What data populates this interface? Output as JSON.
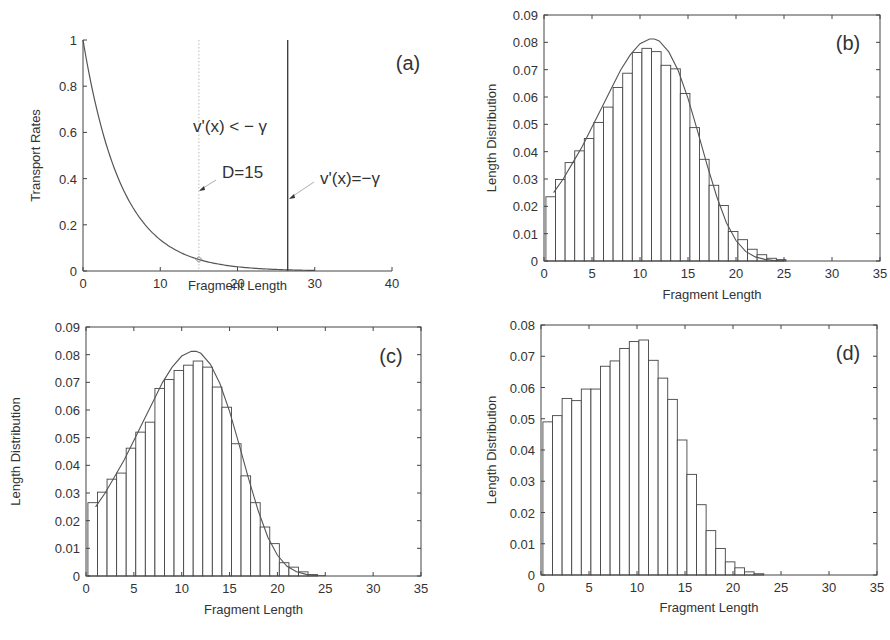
{
  "figure": {
    "panels": [
      {
        "id": "a",
        "label": "(a)"
      },
      {
        "id": "b",
        "label": "(b)"
      },
      {
        "id": "c",
        "label": "(c)"
      },
      {
        "id": "d",
        "label": "(d)"
      }
    ]
  },
  "chart_data": [
    {
      "panel": "(a)",
      "type": "line",
      "title": "",
      "xlabel": "Fragment Length",
      "ylabel": "Transport Rates",
      "xlim": [
        0,
        40
      ],
      "ylim": [
        0,
        1
      ],
      "xticks": [
        0,
        10,
        20,
        30,
        40
      ],
      "yticks": [
        0,
        0.2,
        0.4,
        0.6,
        0.8,
        1
      ],
      "ytick_labels": [
        "0",
        "0.2",
        "0.4",
        "0.6",
        "0.8",
        "1"
      ],
      "grid": false,
      "series": [
        {
          "name": "transport rate v(x)",
          "form": "exp(-x/5)",
          "x": [
            0,
            2,
            4,
            6,
            8,
            10,
            12,
            14,
            15,
            16,
            18,
            20,
            22,
            24,
            26,
            28,
            30
          ],
          "values": [
            1.0,
            0.67,
            0.449,
            0.301,
            0.202,
            0.135,
            0.091,
            0.061,
            0.05,
            0.041,
            0.027,
            0.018,
            0.012,
            0.008,
            0.0055,
            0.0037,
            0.0025
          ]
        }
      ],
      "vlines": [
        {
          "x": 15,
          "style": "dotted",
          "annotation": "D=15"
        },
        {
          "x": 26.5,
          "style": "solid",
          "annotation": "v'(x)=-γ"
        }
      ],
      "marker": {
        "x": 15,
        "y": 0.05,
        "shape": "diamond"
      },
      "annotations": [
        "v'(x) < − γ",
        "D=15",
        "v'(x)=−γ"
      ]
    },
    {
      "panel": "(b)",
      "type": "bar",
      "title": "",
      "xlabel": "Fragment Length",
      "ylabel": "Length Distribution",
      "xlim": [
        0,
        35
      ],
      "ylim": [
        0,
        0.09
      ],
      "xticks": [
        0,
        5,
        10,
        15,
        20,
        25,
        30,
        35
      ],
      "yticks": [
        0,
        0.01,
        0.02,
        0.03,
        0.04,
        0.05,
        0.06,
        0.07,
        0.08,
        0.09
      ],
      "ytick_labels": [
        "0",
        "0.01",
        "0.02",
        "0.03",
        "0.04",
        "0.05",
        "0.06",
        "0.07",
        "0.08",
        "0.09"
      ],
      "bin_start": 0.2,
      "bin_width": 1,
      "values": [
        0.0235,
        0.0298,
        0.036,
        0.0403,
        0.0448,
        0.0507,
        0.0563,
        0.0635,
        0.0687,
        0.0763,
        0.0778,
        0.0766,
        0.0716,
        0.0703,
        0.0613,
        0.0488,
        0.0372,
        0.0277,
        0.0203,
        0.0108,
        0.0078,
        0.0043,
        0.0023,
        0.001,
        0.0005
      ],
      "fit_curve": {
        "x": [
          1,
          2,
          3,
          4,
          5,
          6,
          7,
          8,
          9,
          10,
          11,
          11.5,
          12,
          13,
          14,
          15,
          16,
          17,
          18,
          19,
          20,
          21,
          22,
          23,
          24,
          25
        ],
        "values": [
          0.025,
          0.03,
          0.036,
          0.042,
          0.049,
          0.056,
          0.063,
          0.07,
          0.0755,
          0.0795,
          0.0812,
          0.0812,
          0.0805,
          0.0765,
          0.0695,
          0.0595,
          0.0475,
          0.035,
          0.0235,
          0.014,
          0.0075,
          0.0035,
          0.0015,
          0.0006,
          0.0002,
          0.0001
        ]
      },
      "grid": false
    },
    {
      "panel": "(c)",
      "type": "bar",
      "title": "",
      "xlabel": "Fragment Length",
      "ylabel": "Length Distribution",
      "xlim": [
        0,
        35
      ],
      "ylim": [
        0,
        0.09
      ],
      "xticks": [
        0,
        5,
        10,
        15,
        20,
        25,
        30,
        35
      ],
      "yticks": [
        0,
        0.01,
        0.02,
        0.03,
        0.04,
        0.05,
        0.06,
        0.07,
        0.08,
        0.09
      ],
      "ytick_labels": [
        "0",
        "0.01",
        "0.02",
        "0.03",
        "0.04",
        "0.05",
        "0.06",
        "0.07",
        "0.08",
        "0.09"
      ],
      "bin_start": 0.2,
      "bin_width": 1,
      "values": [
        0.0265,
        0.0303,
        0.035,
        0.0372,
        0.0462,
        0.052,
        0.0556,
        0.0678,
        0.071,
        0.0743,
        0.0762,
        0.0777,
        0.0755,
        0.0683,
        0.061,
        0.0478,
        0.0362,
        0.0265,
        0.0177,
        0.0117,
        0.0048,
        0.0032,
        0.0015,
        0.0005
      ],
      "fit_curve": {
        "x": [
          1,
          2,
          3,
          4,
          5,
          6,
          7,
          8,
          9,
          10,
          11,
          11.5,
          12,
          13,
          14,
          15,
          16,
          17,
          18,
          19,
          20,
          21,
          22,
          23,
          24,
          25
        ],
        "values": [
          0.025,
          0.03,
          0.036,
          0.042,
          0.049,
          0.056,
          0.063,
          0.07,
          0.0755,
          0.0795,
          0.0812,
          0.0812,
          0.0805,
          0.0765,
          0.0695,
          0.0595,
          0.0475,
          0.035,
          0.0235,
          0.014,
          0.0075,
          0.0035,
          0.0015,
          0.0006,
          0.0002,
          0.0001
        ]
      },
      "grid": false
    },
    {
      "panel": "(d)",
      "type": "bar",
      "title": "",
      "xlabel": "Fragment Length",
      "ylabel": "Length Distribution",
      "xlim": [
        0,
        35
      ],
      "ylim": [
        0,
        0.08
      ],
      "xticks": [
        0,
        5,
        10,
        15,
        20,
        25,
        30,
        35
      ],
      "yticks": [
        0,
        0.01,
        0.02,
        0.03,
        0.04,
        0.05,
        0.06,
        0.07,
        0.08
      ],
      "ytick_labels": [
        "0",
        "0.01",
        "0.02",
        "0.03",
        "0.04",
        "0.05",
        "0.06",
        "0.07",
        "0.08"
      ],
      "bin_start": 0.2,
      "bin_width": 1,
      "values": [
        0.049,
        0.051,
        0.0565,
        0.0558,
        0.0595,
        0.0595,
        0.0668,
        0.0685,
        0.0725,
        0.0747,
        0.0752,
        0.0687,
        0.063,
        0.0562,
        0.0432,
        0.0322,
        0.0225,
        0.0142,
        0.0085,
        0.0042,
        0.0023,
        0.001,
        0.0004
      ],
      "grid": false
    }
  ],
  "colors": {
    "ink": "#333333",
    "bar_fill": "#ffffff",
    "bar_stroke": "#444444",
    "dotted_line": "#bbbbbb"
  }
}
